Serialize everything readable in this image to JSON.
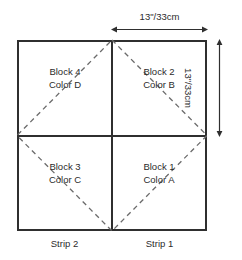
{
  "diagram": {
    "background_color": "#ffffff",
    "line_color": "#2f2f2f",
    "text_color": "#2b2b2b",
    "dimensions": {
      "top": {
        "label": "13\"/33cm",
        "orientation": "horizontal",
        "arrow_style": "double-headed"
      },
      "right": {
        "label": "13\"/33cm",
        "orientation": "vertical",
        "arrow_style": "double-headed"
      }
    },
    "quadrants": [
      {
        "position": "top-left",
        "block": "Block 4",
        "color": "Color D"
      },
      {
        "position": "top-right",
        "block": "Block 2",
        "color": "Color B"
      },
      {
        "position": "bottom-left",
        "block": "Block 3",
        "color": "Color C"
      },
      {
        "position": "bottom-right",
        "block": "Block 1",
        "color": "Color A"
      }
    ],
    "strips": [
      {
        "position": "left",
        "label": "Strip 2"
      },
      {
        "position": "right",
        "label": "Strip 1"
      }
    ],
    "overlay": {
      "shape": "diamond",
      "line_style": "dashed",
      "description": "dashed diamond connecting midpoints of the four outer edges"
    }
  }
}
